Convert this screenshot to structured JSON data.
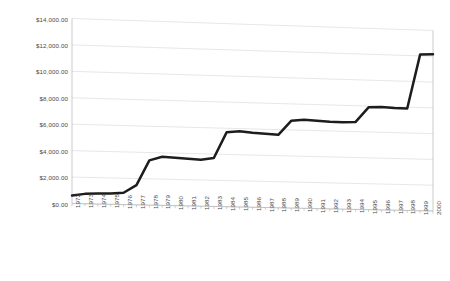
{
  "chart_data": {
    "type": "line",
    "title": "",
    "subtitle": "",
    "xlabel": "",
    "ylabel": "",
    "ylim": [
      0,
      14000
    ],
    "ytick_labels": [
      "$0.00",
      "$2,000.00",
      "$4,000.00",
      "$6,000.00",
      "$8,000.00",
      "$10,000.00",
      "$12,000.00",
      "$14,000.00"
    ],
    "ytick_values": [
      0,
      2000,
      4000,
      6000,
      8000,
      10000,
      12000,
      14000
    ],
    "grid": true,
    "legend": "none",
    "line_color": "#1d1d1d",
    "grid_color": "#d7d7d7",
    "categories": [
      "1972",
      "1973",
      "1974",
      "1975",
      "1976",
      "1977",
      "1978",
      "1979",
      "1980",
      "1981",
      "1982",
      "1983",
      "1984",
      "1985",
      "1986",
      "1987",
      "1988",
      "1989",
      "1990",
      "1991",
      "1992",
      "1993",
      "1994",
      "1995",
      "1996",
      "1997",
      "1998",
      "1999",
      "2000"
    ],
    "values": [
      600,
      750,
      800,
      820,
      900,
      1500,
      3400,
      3700,
      3650,
      3600,
      3550,
      3700,
      5700,
      5800,
      5700,
      5650,
      5600,
      6700,
      6800,
      6750,
      6700,
      6700,
      6750,
      7900,
      7950,
      7900,
      7900,
      12100,
      12150
    ],
    "series": [
      {
        "name": "amount",
        "values": [
          600,
          750,
          800,
          820,
          900,
          1500,
          3400,
          3700,
          3650,
          3600,
          3550,
          3700,
          5700,
          5800,
          5700,
          5650,
          5600,
          6700,
          6800,
          6750,
          6700,
          6700,
          6750,
          7900,
          7950,
          7900,
          7900,
          12100,
          12150
        ]
      }
    ]
  }
}
